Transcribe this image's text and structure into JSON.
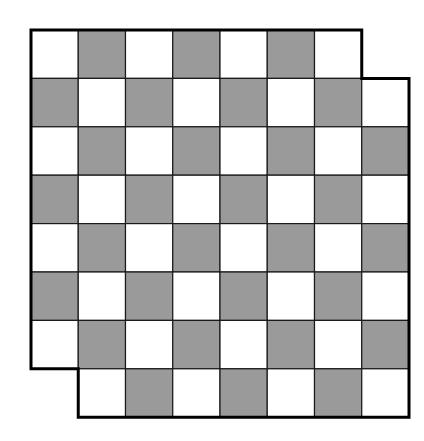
{
  "diagram": {
    "type": "mutilated-checkerboard",
    "rows": 8,
    "cols": 8,
    "origin": {
      "x": 31,
      "y": 30
    },
    "cell_width": 47.25,
    "cell_height": 48.4,
    "top_left_color": "light",
    "removed_cells": [
      {
        "row": 0,
        "col": 7,
        "position": "top-right"
      },
      {
        "row": 7,
        "col": 0,
        "position": "bottom-left"
      }
    ],
    "colors": {
      "light": "#ffffff",
      "dark": "#9a9a9a",
      "grid_line": "#1a1a1a",
      "border": "#000000",
      "background": "#ffffff"
    },
    "grid_line_width": 1.2,
    "border_width": 3
  }
}
